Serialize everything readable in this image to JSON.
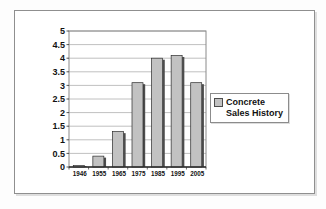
{
  "chart_data": {
    "type": "bar",
    "title": "",
    "categories": [
      "1946",
      "1955",
      "1965",
      "1975",
      "1985",
      "1995",
      "2005"
    ],
    "values": [
      0.05,
      0.4,
      1.3,
      3.1,
      4.0,
      4.1,
      3.1
    ],
    "series_name": "Concrete Sales History",
    "xlabel": "",
    "ylabel": "",
    "ylim": [
      0,
      5
    ],
    "yticks": [
      0,
      0.5,
      1,
      1.5,
      2,
      2.5,
      3,
      3.5,
      4,
      4.5,
      5
    ],
    "ytick_labels": [
      "0",
      "0.5",
      "1",
      "1.5",
      "2",
      "2.5",
      "3",
      "3.5",
      "4",
      "4.5",
      "5"
    ],
    "grid": true,
    "legend": {
      "label": "Concrete Sales History",
      "position": "right"
    },
    "colors": {
      "bar_fill": "#c2c2c2",
      "bar_stroke": "#2b2b2b",
      "bar_shadow": "#4d4d4d",
      "grid": "#b0b0b0",
      "plot_border": "#8a8a8a",
      "axis": "#2b2b2b",
      "text": "#111111",
      "plot_background": "#ffffff"
    }
  }
}
